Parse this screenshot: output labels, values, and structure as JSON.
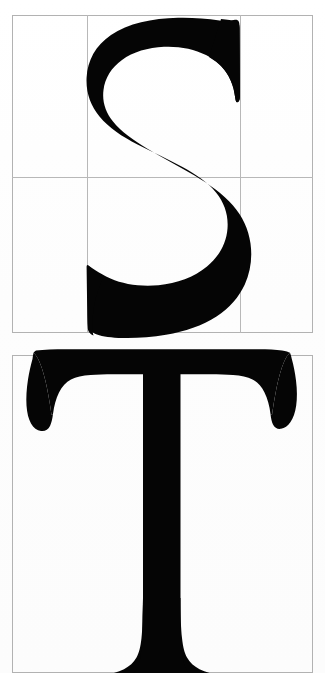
{
  "page": {
    "kind": "type-specimen-scan",
    "width": 325,
    "height": 673,
    "background_color": "#fdfdfd",
    "ink_color": "#050505",
    "grid_line_color": "#b8b8b8",
    "frame_line_color": "#b2b2b2",
    "caption": ""
  },
  "specimens": [
    {
      "id": "specimen-s",
      "letter": "S",
      "letter_name": "capital-s",
      "typeface_style": "serif",
      "frame": {
        "x": 12,
        "y": 15,
        "width": 301,
        "height": 318
      },
      "grid": {
        "columns": 3,
        "rows": 2,
        "vertical_divider_x": [
          87,
          240
        ],
        "horizontal_divider_y": [
          177
        ]
      },
      "glyph_box": {
        "x": 86,
        "y": 18,
        "width": 148,
        "height": 320
      }
    },
    {
      "id": "specimen-t",
      "letter": "T",
      "letter_name": "capital-t",
      "typeface_style": "serif",
      "frame": {
        "x": 12,
        "y": 355,
        "width": 301,
        "height": 318
      },
      "grid": {
        "columns": 1,
        "rows": 1,
        "vertical_divider_x": [],
        "horizontal_divider_y": []
      },
      "glyph_box": {
        "x": 24,
        "y": 348,
        "width": 262,
        "height": 325
      }
    }
  ]
}
